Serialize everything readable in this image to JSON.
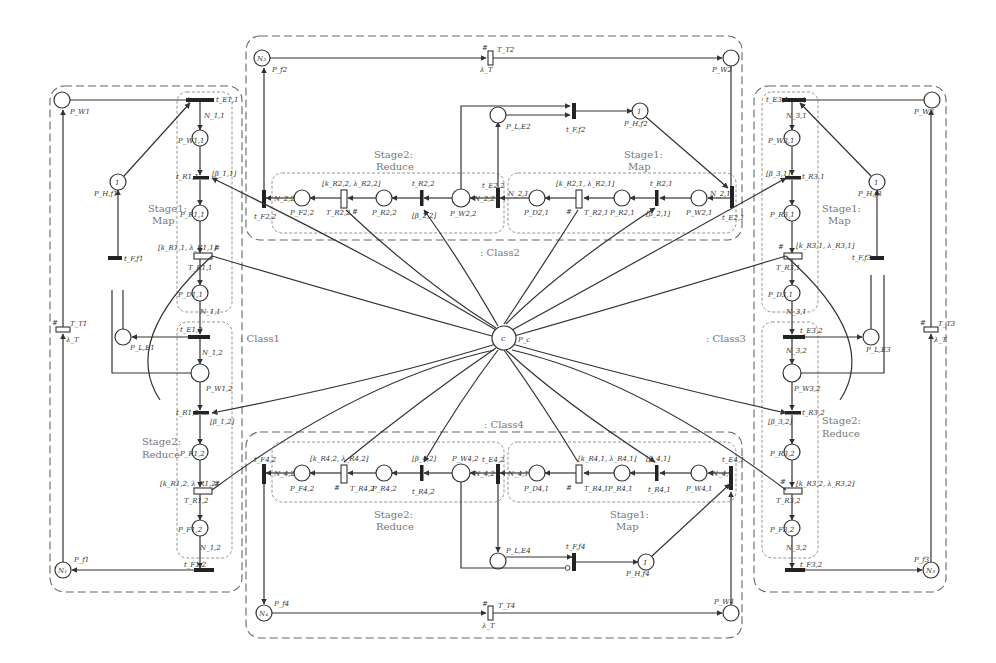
{
  "figure": {
    "type": "stochastic-petri-net",
    "central_place": {
      "token": "c",
      "label": "P_c"
    },
    "classes": [
      {
        "name": ": Class1",
        "pool_place": {
          "token": "N_1",
          "label": "P_f1"
        },
        "wait_place": "P_W1",
        "timed_transition": {
          "label": "T_T1",
          "rate": "λ_T",
          "marker": "#"
        },
        "holder": {
          "token": "1",
          "label": "P_H,f1"
        },
        "free_transition": "t_F,f1",
        "lock_place": "P_L,E1",
        "stages": [
          {
            "title": "Stage1:",
            "subtitle": "Map",
            "entry_transition": "t_E1,1",
            "entry_weight": "N_1,1",
            "places": [
              "P_WT,1",
              "P_R1,1",
              "P_D1,1"
            ],
            "immediate": {
              "label": "t_R1,1",
              "guard": "[β_1,1]"
            },
            "timed": {
              "label": "T_R1,1",
              "params": "[k_R1,1, λ_R1,1]",
              "marker": "#"
            },
            "exit_weight": "N_1,1"
          },
          {
            "title": "Stage2:",
            "subtitle": "Reduce",
            "entry_transition": "t_E1,2",
            "entry_weight": "N_1,2",
            "places": [
              "P_W1,2",
              "P_R1,2",
              "P_F1,2"
            ],
            "immediate": {
              "label": "t_R1,2",
              "guard": "[β_1,2]"
            },
            "timed": {
              "label": "T_R1,2",
              "params": "[k_R1,2, λ_R1,2]",
              "marker": "#"
            },
            "exit_weight": "N_1,2",
            "exit_transition": "t_F1,2"
          }
        ]
      },
      {
        "name": ": Class2",
        "pool_place": {
          "token": "N_2",
          "label": "P_f2"
        },
        "wait_place": "P_W2",
        "timed_transition": {
          "label": "T_T2",
          "rate": "λ_T",
          "marker": "#"
        },
        "holder": {
          "token": "1",
          "label": "P_H,f2"
        },
        "free_transition": "t_F,f2",
        "lock_place": "P_L,E2",
        "stages": [
          {
            "title": "Stage1:",
            "subtitle": "Map",
            "entry_transition": "t_E2,1",
            "entry_weight": "N_2,1",
            "places": [
              "P_W2,1",
              "P_R2,1",
              "P_D2,1"
            ],
            "immediate": {
              "label": "t_R2,1",
              "guard": "[β_2,1]"
            },
            "timed": {
              "label": "T_R2,1",
              "params": "[k_R2,1, λ_R2,1]",
              "marker": "#"
            },
            "exit_weight": "N_2,1"
          },
          {
            "title": "Stage2:",
            "subtitle": "Reduce",
            "entry_transition": "t_E2,2",
            "entry_weight": "N_2,2",
            "places": [
              "P_W2,2",
              "P_R2,2",
              "P_F2,2"
            ],
            "immediate": {
              "label": "t_R2,2",
              "guard": "[β_2,2]"
            },
            "timed": {
              "label": "T_R2,2",
              "params": "[k_R2,2, λ_R2,2]",
              "marker": "#"
            },
            "exit_weight": "N_2,2",
            "exit_transition": "t_F2,2"
          }
        ]
      },
      {
        "name": ": Class3",
        "pool_place": {
          "token": "N_3",
          "label": "P_f3"
        },
        "wait_place": "P_W3",
        "timed_transition": {
          "label": "T_T3",
          "rate": "λ_T",
          "marker": "#"
        },
        "holder": {
          "token": "1",
          "label": "P_H,f3"
        },
        "free_transition": "t_F,f3",
        "lock_place": "P_L,E3",
        "stages": [
          {
            "title": "Stage1:",
            "subtitle": "Map",
            "entry_transition": "t_E3,1",
            "entry_weight": "N_3,1",
            "places": [
              "P_W3,1",
              "P_R3,1",
              "P_D3,1"
            ],
            "immediate": {
              "label": "t_R3,1",
              "guard": "[β_3,1]"
            },
            "timed": {
              "label": "T_R3,1",
              "params": "[k_R3,1, λ_R3,1]",
              "marker": "#"
            },
            "exit_weight": "N_3,1"
          },
          {
            "title": "Stage2:",
            "subtitle": "Reduce",
            "entry_transition": "t_E3,2",
            "entry_weight": "N_3,2",
            "places": [
              "P_W3,2",
              "P_R3,2",
              "P_F3,2"
            ],
            "immediate": {
              "label": "t_R3,2",
              "guard": "[β_3,2]"
            },
            "timed": {
              "label": "T_R3,2",
              "params": "[k_R3,2, λ_R3,2]",
              "marker": "#"
            },
            "exit_weight": "N_3,2",
            "exit_transition": "t_F3,2"
          }
        ]
      },
      {
        "name": ": Class4",
        "pool_place": {
          "token": "N_4",
          "label": "P_f4"
        },
        "wait_place": "P_W4",
        "timed_transition": {
          "label": "T_T4",
          "rate": "λ_T",
          "marker": "#"
        },
        "holder": {
          "token": "1",
          "label": "P_H,f4"
        },
        "free_transition": "t_F,f4",
        "lock_place": "P_L,E4",
        "stages": [
          {
            "title": "Stage1:",
            "subtitle": "Map",
            "entry_transition": "t_E4,1",
            "entry_weight": "N_4,1",
            "places": [
              "P_W4,1",
              "P_R4,1",
              "P_D4,1"
            ],
            "immediate": {
              "label": "t_R4,1",
              "guard": "[β_4,1]"
            },
            "timed": {
              "label": "T_R4,1",
              "params": "[k_R4,1, λ_R4,1]",
              "marker": "#"
            },
            "exit_weight": "N_4,1"
          },
          {
            "title": "Stage2:",
            "subtitle": "Reduce",
            "entry_transition": "t_E4,2",
            "entry_weight": "N_4,2",
            "places": [
              "P_W4,2",
              "P_R4,2",
              "P_F4,2"
            ],
            "immediate": {
              "label": "t_R4,2",
              "guard": "[β_4,2]"
            },
            "timed": {
              "label": "T_R4,2",
              "params": "[k_R4,2, λ_R4,2]",
              "marker": "#"
            },
            "exit_weight": "N_4,2",
            "exit_transition": "t_F4,2"
          }
        ]
      }
    ]
  },
  "labels": {
    "c1": {
      "pool_token": "N₁",
      "pool": "P_f1",
      "wait": "P_W1",
      "TT": "T_T1",
      "rate": "λ_T",
      "hash": "#",
      "holder_token": "1",
      "holder": "P_H,f1",
      "tf": "t_F,f1",
      "lock": "P_L,E1",
      "s1_title": "Stage1:",
      "s1_sub": "Map",
      "s2_title": "Stage2:",
      "s2_sub": "Reduce",
      "tE11": "t_E1,1",
      "N11": "N_1,1",
      "PW11": "P_W1,1",
      "tR11": "t_R1,1",
      "g11": "[β_1,1]",
      "PR11": "P_R1,1",
      "k11": "[k_R1,1, λ_R1,1]",
      "TR11": "T_R1,1",
      "PD11": "P_D1,1",
      "N11b": "N_1,1",
      "tE12": "t_E1,2",
      "N12": "N_1,2",
      "PW12": "P_W1,2",
      "tR12": "t_R1,2",
      "g12": "[β_1,2]",
      "PR12": "P_R1,2",
      "k12": "[k_R1,2, λ_R1,2]",
      "TR12": "T_R1,2",
      "PF12": "P_F1,2",
      "N12b": "N_1,2",
      "tF12": "t_F1,2",
      "class": ": Class1"
    },
    "c2": {
      "pool_token": "N₂",
      "pool": "P_f2",
      "wait": "P_W2",
      "TT": "T_T2",
      "rate": "λ_T",
      "hash": "#",
      "holder_token": "1",
      "holder": "P_H,f2",
      "tf": "t_F,f2",
      "lock": "P_L,E2",
      "s1_title": "Stage1:",
      "s1_sub": "Map",
      "s2_title": "Stage2:",
      "s2_sub": "Reduce",
      "tE21": "t_E2,1",
      "N21": "N_2,1",
      "PW21": "P_W2,1",
      "tR21": "t_R2,1",
      "g21": "[β_2,1]",
      "PR21": "P_R2,1",
      "k21": "[k_R2,1, λ_R2,1]",
      "TR21": "T_R2,1",
      "PD21": "P_D2,1",
      "N21b": "N_2,1",
      "tE22": "t_E2,2",
      "N22": "N_2,2",
      "PW22": "P_W2,2",
      "tR22": "t_R2,2",
      "g22": "[β_2,2]",
      "PR22": "P_R2,2",
      "k22": "[k_R2,2, λ_R2,2]",
      "TR22": "T_R2,2",
      "PF22": "P_F2,2",
      "N22b": "N_2,2",
      "tF22": "t_F2,2",
      "class": ": Class2"
    },
    "c3": {
      "pool_token": "N₃",
      "pool": "P_f3",
      "wait": "P_W3",
      "TT": "T_T3",
      "rate": "λ_T",
      "hash": "#",
      "holder_token": "1",
      "holder": "P_H,f3",
      "tf": "t_F,f3",
      "lock": "P_L,E3",
      "s1_title": "Stage1:",
      "s1_sub": "Map",
      "s2_title": "Stage2:",
      "s2_sub": "Reduce",
      "tE31": "t_E3,1",
      "N31": "N_3,1",
      "PW31": "P_W3,1",
      "tR31": "t_R3,1",
      "g31": "[β_3,1]",
      "PR31": "P_R3,1",
      "k31": "[k_R3,1, λ_R3,1]",
      "TR31": "T_R3,1",
      "PD31": "P_D3,1",
      "N31b": "N_3,1",
      "tE32": "t_E3,2",
      "N32": "N_3,2",
      "PW32": "P_W3,2",
      "tR32": "t_R3,2",
      "g32": "[β_3,2]",
      "PR32": "P_R3,2",
      "k32": "[k_R3,2, λ_R3,2]",
      "TR32": "T_R3,2",
      "PF32": "P_F3,2",
      "N32b": "N_3,2",
      "tF32": "t_F3,2",
      "class": ": Class3"
    },
    "c4": {
      "pool_token": "N₄",
      "pool": "P_f4",
      "wait": "P_W4",
      "TT": "T_T4",
      "rate": "λ_T",
      "hash": "#",
      "holder_token": "1",
      "holder": "P_H,f4",
      "tf": "t_F,f4",
      "lock": "P_L,E4",
      "s1_title": "Stage1:",
      "s1_sub": "Map",
      "s2_title": "Stage2:",
      "s2_sub": "Reduce",
      "tE41": "t_E4,1",
      "N41": "N_4,1",
      "PW41": "P_W4,1",
      "tR41": "t_R4,1",
      "g41": "[β_4,1]",
      "PR41": "P_R4,1",
      "k41": "[k_R4,1, λ_R4,1]",
      "TR41": "T_R4,1",
      "PD41": "P_D4,1",
      "N41b": "N_4,1",
      "tE42": "t_E4,2",
      "N42": "N_4,2",
      "PW42": "P_W4,2",
      "tR42": "t_R4,2",
      "g42": "[β_4,2]",
      "PR42": "P_R4,2",
      "k42": "[k_R4,2, λ_R4,2]",
      "TR42": "T_R4,2",
      "PF42": "P_F4,2",
      "N42b": "N_4,2",
      "tF42": "t_F4,2",
      "class": ": Class4"
    },
    "center": {
      "token": "c",
      "label": "P_c"
    }
  }
}
